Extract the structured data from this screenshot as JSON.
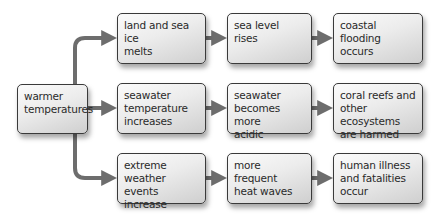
{
  "diagram": {
    "arrow_color": "#6d6d6d",
    "box_border_color": "#3a3a3a",
    "source": {
      "label": "warmer\ntemperatures"
    },
    "rows": [
      {
        "nodes": [
          {
            "label": "land and sea ice\nmelts"
          },
          {
            "label": "sea level rises"
          },
          {
            "label": "coastal\nflooding\noccurs"
          }
        ]
      },
      {
        "nodes": [
          {
            "label": "seawater\ntemperature\nincreases"
          },
          {
            "label": "seawater\nbecomes more\nacidic"
          },
          {
            "label": "coral reefs and\nother ecosystems\nare harmed"
          }
        ]
      },
      {
        "nodes": [
          {
            "label": "extreme weather\nevents increase"
          },
          {
            "label": "more frequent\nheat waves"
          },
          {
            "label": "human illness\nand fatalities\noccur"
          }
        ]
      }
    ]
  }
}
